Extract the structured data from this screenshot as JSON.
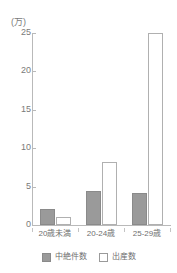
{
  "chart_data": {
    "type": "bar",
    "title": "",
    "xlabel": "",
    "ylabel": "(万)",
    "unit_label": "(万)",
    "categories": [
      "20歳未満",
      "20-24歳",
      "25-29歳"
    ],
    "series": [
      {
        "name": "中絶件数",
        "values": [
          2.1,
          4.4,
          4.2
        ],
        "style": "filled",
        "color": "#9a9a9a"
      },
      {
        "name": "出産数",
        "values": [
          1.0,
          8.2,
          25.0
        ],
        "style": "hollow",
        "color": "#ffffff"
      }
    ],
    "ylim": [
      0,
      25
    ],
    "yticks": [
      0,
      5,
      10,
      15,
      20,
      25
    ],
    "ytick_labels": [
      "0",
      "5",
      "10",
      "15",
      "20",
      "25"
    ],
    "grid": false,
    "legend_position": "bottom"
  },
  "legend": {
    "items": [
      {
        "label": "中絶件数",
        "style": "filled"
      },
      {
        "label": "出産数",
        "style": "hollow"
      }
    ]
  },
  "axis": {
    "unit": "(万)"
  }
}
